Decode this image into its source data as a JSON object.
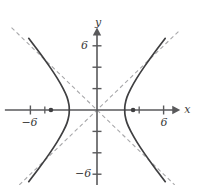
{
  "figure": {
    "kind": "hyperbola-graph",
    "background_color": "#ffffff",
    "axis_color": "#59595b",
    "curve_color": "#3f3f41",
    "asymptote_color": "#a8a8aa",
    "label_color": "#3a3a3a"
  },
  "axes": {
    "x_label": "x",
    "y_label": "y",
    "origin_px": {
      "x": 97,
      "y": 110
    },
    "px_per_unit_x": 11.1,
    "px_per_unit_y": 10.7,
    "x_range": [
      -8.3,
      7.5
    ],
    "y_range": [
      -7.0,
      7.7
    ],
    "x_ticks": [
      -6,
      6
    ],
    "y_ticks": [
      6,
      -6
    ],
    "x_tick_labels": [
      "−6",
      "6"
    ],
    "y_tick_labels": [
      "6",
      "−6"
    ],
    "minor_y_ticks": [
      -4,
      -2,
      2,
      4
    ],
    "arrow_x": true,
    "arrow_y": true,
    "grid": false
  },
  "chart_data": {
    "type": "line",
    "title": "",
    "xlabel": "x",
    "ylabel": "y",
    "xlim": [
      -8.3,
      7.5
    ],
    "ylim": [
      -7.0,
      7.7
    ],
    "grid": false,
    "equation": "x^2/a^2 - y^2/b^2 = 1",
    "a": 2.5,
    "b": 2.5,
    "c": 3.54,
    "orientation": "horizontal",
    "vertices": [
      {
        "x": -2.5,
        "y": 0
      },
      {
        "x": 2.5,
        "y": 0
      }
    ],
    "foci": [
      {
        "x": -4.15,
        "y": 0
      },
      {
        "x": 3.25,
        "y": 0
      }
    ],
    "focus_marker": "filled-dot",
    "asymptotes": [
      {
        "slope": 1,
        "intercept": 0,
        "style": "dashed"
      },
      {
        "slope": -1,
        "intercept": 0,
        "style": "dashed"
      }
    ],
    "series": [
      {
        "name": "right-branch",
        "style": "solid",
        "points": [
          {
            "x": 6.15,
            "y": -6.7
          },
          {
            "x": 5.2,
            "y": -5.4
          },
          {
            "x": 4.3,
            "y": -4.1
          },
          {
            "x": 3.6,
            "y": -3.0
          },
          {
            "x": 3.05,
            "y": -2.0
          },
          {
            "x": 2.7,
            "y": -1.2
          },
          {
            "x": 2.53,
            "y": -0.5
          },
          {
            "x": 2.5,
            "y": 0
          },
          {
            "x": 2.53,
            "y": 0.5
          },
          {
            "x": 2.7,
            "y": 1.2
          },
          {
            "x": 3.05,
            "y": 2.0
          },
          {
            "x": 3.6,
            "y": 3.0
          },
          {
            "x": 4.3,
            "y": 4.1
          },
          {
            "x": 5.2,
            "y": 5.4
          },
          {
            "x": 6.15,
            "y": 6.7
          }
        ]
      },
      {
        "name": "left-branch",
        "style": "solid",
        "points": [
          {
            "x": -6.15,
            "y": -6.7
          },
          {
            "x": -5.2,
            "y": -5.4
          },
          {
            "x": -4.3,
            "y": -4.1
          },
          {
            "x": -3.6,
            "y": -3.0
          },
          {
            "x": -3.05,
            "y": -2.0
          },
          {
            "x": -2.7,
            "y": -1.2
          },
          {
            "x": -2.53,
            "y": -0.5
          },
          {
            "x": -2.5,
            "y": 0
          },
          {
            "x": -2.53,
            "y": 0.5
          },
          {
            "x": -2.7,
            "y": 1.2
          },
          {
            "x": -3.05,
            "y": 2.0
          },
          {
            "x": -3.6,
            "y": 3.0
          },
          {
            "x": -4.3,
            "y": 4.1
          },
          {
            "x": -5.2,
            "y": 5.4
          },
          {
            "x": -6.15,
            "y": 6.7
          }
        ]
      }
    ]
  }
}
